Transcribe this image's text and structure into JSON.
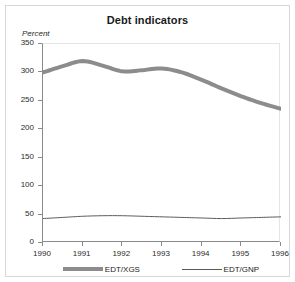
{
  "figure": {
    "title": "Debt indicators",
    "ylabel": "Percent",
    "background": "#ffffff",
    "border_color": "#d8d8d8"
  },
  "axes": {
    "y_ticks": [
      "0",
      "50",
      "100",
      "150",
      "200",
      "250",
      "300",
      "350"
    ],
    "x_ticks": [
      "1990",
      "1991",
      "1992",
      "1993",
      "1994",
      "1995",
      "1996"
    ]
  },
  "legend": {
    "items": [
      {
        "label": "EDT/XGS",
        "color": "#8c8c8c",
        "style": "thick-line"
      },
      {
        "label": "EDT/GNP",
        "color": "#5a5a5a",
        "style": "thin-line"
      }
    ]
  },
  "chart_data": {
    "type": "line",
    "title": "Debt indicators",
    "xlabel": "",
    "ylabel": "Percent",
    "xlim": [
      1990,
      1996
    ],
    "ylim": [
      0,
      350
    ],
    "ytick_step": 50,
    "grid": false,
    "legend_position": "bottom",
    "x": [
      1990,
      1990.5,
      1991,
      1991.5,
      1992,
      1992.5,
      1993,
      1993.5,
      1994,
      1994.5,
      1995,
      1995.5,
      1996
    ],
    "series": [
      {
        "name": "EDT/XGS",
        "color": "#8c8c8c",
        "linewidth_px": 4,
        "values": [
          300,
          311,
          320,
          312,
          302,
          304,
          307,
          300,
          287,
          272,
          258,
          246,
          236
        ]
      },
      {
        "name": "EDT/GNP",
        "color": "#5a5a5a",
        "linewidth_px": 1,
        "values": [
          43,
          45,
          47,
          48,
          48,
          47,
          46,
          45,
          44,
          43,
          44,
          45,
          46
        ]
      }
    ]
  }
}
